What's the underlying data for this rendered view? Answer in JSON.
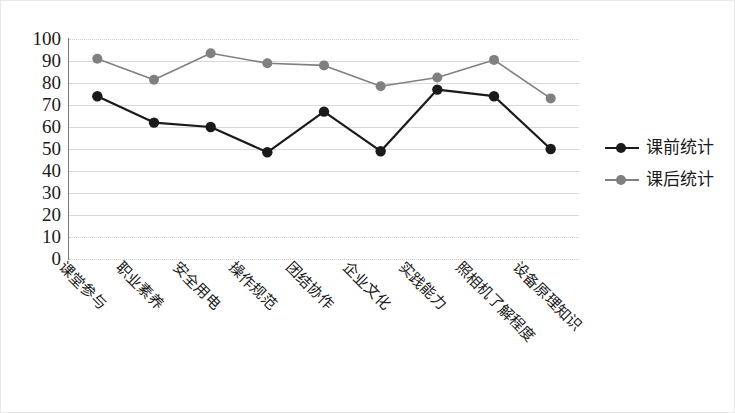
{
  "chart_data": {
    "type": "line",
    "title": "",
    "xlabel": "",
    "ylabel": "",
    "ylim": [
      0,
      100
    ],
    "ytick_step": 10,
    "yticks": [
      "100",
      "90",
      "80",
      "70",
      "60",
      "50",
      "40",
      "30",
      "20",
      "10",
      "0"
    ],
    "grid": true,
    "legend_position": "right",
    "categories": [
      "课堂参与",
      "职业素养",
      "安全用电",
      "操作规范",
      "团结协作",
      "企业文化",
      "实践能力",
      "照相机了解程度",
      "设备原理知识"
    ],
    "series": [
      {
        "name": "课前统计",
        "color": "#1a1a1a",
        "marker": "circle",
        "values": [
          74,
          62,
          60,
          48.5,
          67,
          49,
          77,
          74,
          50
        ]
      },
      {
        "name": "课后统计",
        "color": "#808080",
        "marker": "circle",
        "values": [
          91,
          81.5,
          93.5,
          89,
          88,
          78.5,
          82.5,
          90.5,
          73
        ]
      }
    ]
  },
  "legend": {
    "items": [
      {
        "label": "课前统计",
        "color": "#1a1a1a"
      },
      {
        "label": "课后统计",
        "color": "#808080"
      }
    ]
  },
  "colors": {
    "series_pre": "#1a1a1a",
    "series_post": "#808080",
    "gridline": "#d9d9d9",
    "axis": "#7a7a7a",
    "border": "#e8e8e8",
    "background": "#ffffff"
  }
}
